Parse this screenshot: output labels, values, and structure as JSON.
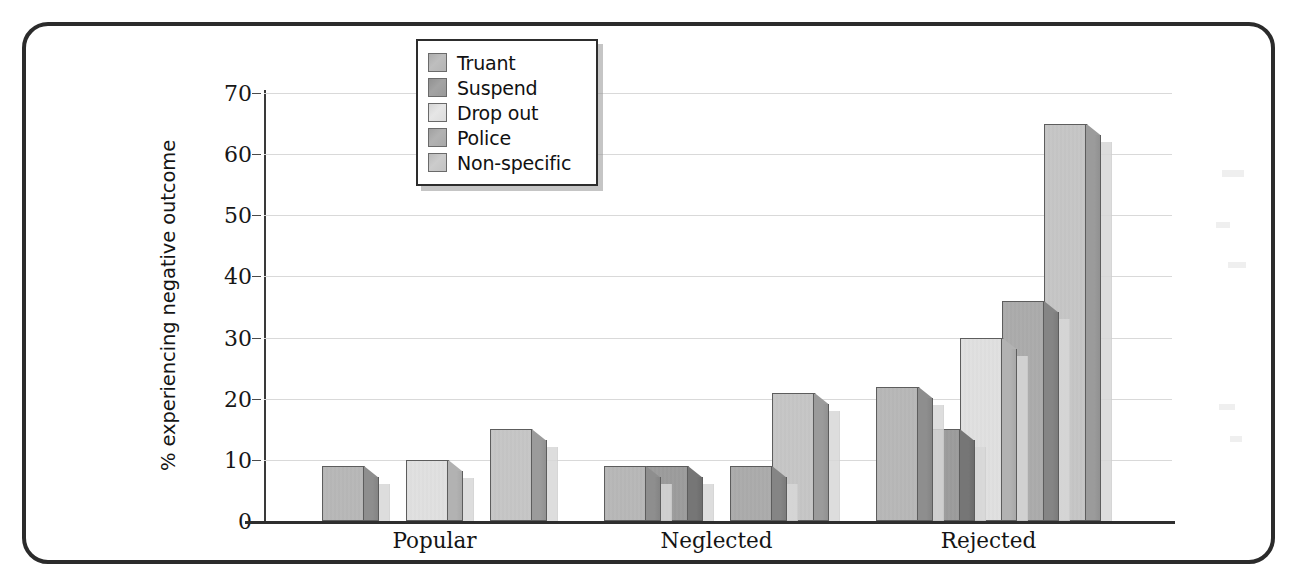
{
  "chart_data": {
    "type": "bar",
    "title": "",
    "xlabel": "",
    "ylabel": "% experiencing negative outcome",
    "categories": [
      "Popular",
      "Neglected",
      "Rejected"
    ],
    "series": [
      {
        "name": "Truant",
        "values": [
          9,
          9,
          22
        ],
        "color": "#b4b4b4",
        "side_color": "#8e8e8e"
      },
      {
        "name": "Suspend",
        "values": [
          0,
          9,
          15
        ],
        "color": "#999999",
        "side_color": "#767676"
      },
      {
        "name": "Drop out",
        "values": [
          10,
          0,
          30
        ],
        "color": "#dcdcdc",
        "side_color": "#b2b2b2"
      },
      {
        "name": "Police",
        "values": [
          0,
          9,
          36
        ],
        "color": "#a8a8a8",
        "side_color": "#858585"
      },
      {
        "name": "Non-specific",
        "values": [
          15,
          21,
          65
        ],
        "color": "#c2c2c2",
        "side_color": "#9b9b9b"
      }
    ],
    "ylim": [
      0,
      70
    ],
    "yticks": [
      0,
      10,
      20,
      30,
      40,
      50,
      60,
      70
    ],
    "ytick_labels": [
      "0",
      "10",
      "20",
      "30",
      "40",
      "50",
      "60",
      "70"
    ],
    "grid": true,
    "legend_position": "top-center",
    "legend_entries": [
      "Truant",
      "Suspend",
      "Drop out",
      "Police",
      "Non-specific"
    ]
  },
  "axis": {
    "y_label": "% experiencing negative outcome"
  },
  "colors": {
    "frame": "#2b2b2b",
    "grid": "#d9d9d9",
    "axis": "#2e2e2e",
    "text": "#141414"
  }
}
